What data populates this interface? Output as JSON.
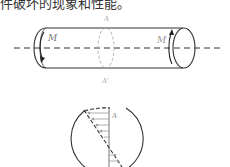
{
  "caption_fragment": "件破坏的现象和性能。",
  "figure": {
    "shaft": {
      "left_moment_label": "M",
      "right_moment_label": "M",
      "section_top_label": "A",
      "section_bottom_label": "A'"
    },
    "cross_section": {
      "point_label": "A"
    }
  }
}
